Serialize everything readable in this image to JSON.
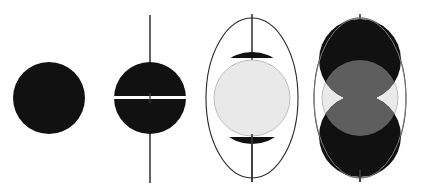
{
  "figure": {
    "title": "Four-stage circle and ellipse construction sequence",
    "background_color": "#ffffff",
    "width": 422,
    "height": 194,
    "panel_count": 4
  },
  "palette": {
    "black": "#111111",
    "dark_fill": "#0d0d0d",
    "mid_gray": "#5e5e5e",
    "light_gray": "#e9e9e9",
    "light_gray_stroke": "#bdbdbd",
    "axis_line": "#3a3a3a",
    "ellipse_stroke": "#262626",
    "white": "#ffffff"
  },
  "panels": [
    {
      "id": "panel-1",
      "label": "Solid disc",
      "center_x": 49,
      "center_y": 98,
      "shapes": [
        {
          "kind": "circle",
          "name": "solid-black-disc",
          "cx": 49,
          "cy": 98,
          "r": 36,
          "fill": "#111111",
          "stroke": "none"
        }
      ],
      "has_axis": false,
      "has_ellipse": false
    },
    {
      "id": "panel-2",
      "label": "Disc bisected by equatorial gap with polar axis",
      "center_x": 150,
      "center_y": 98,
      "shapes": [
        {
          "kind": "circle",
          "name": "black-disc",
          "cx": 150,
          "cy": 98,
          "r": 36,
          "fill": "#111111",
          "stroke": "none"
        },
        {
          "kind": "band",
          "name": "equatorial-white-gap",
          "x": 112,
          "y": 96,
          "width": 76,
          "height": 3,
          "fill": "#ffffff"
        }
      ],
      "has_axis": true,
      "axis": {
        "x": 150,
        "y1": 15,
        "y2": 183,
        "width": 1.6,
        "color": "#3a3a3a"
      },
      "has_ellipse": false
    },
    {
      "id": "panel-3",
      "label": "Ellipse with polar caps and central light disc",
      "center_x": 252,
      "center_y": 98,
      "shapes": [
        {
          "kind": "ellipse",
          "name": "outer-ellipse-outline",
          "cx": 252,
          "cy": 98,
          "rx": 46,
          "ry": 80,
          "fill": "none",
          "stroke": "#262626",
          "stroke_width": 1.1
        },
        {
          "kind": "cap",
          "name": "top-polar-cap",
          "cx": 252,
          "cy": 93,
          "r": 41,
          "flat_y": 58,
          "side": "top",
          "fill": "#111111"
        },
        {
          "kind": "cap",
          "name": "bottom-polar-cap",
          "cx": 252,
          "cy": 103,
          "r": 41,
          "flat_y": 137,
          "side": "bottom",
          "fill": "#111111"
        },
        {
          "kind": "circle",
          "name": "central-light-disc",
          "cx": 252,
          "cy": 98,
          "r": 38,
          "fill": "#e9e9e9",
          "stroke": "#bdbdbd",
          "stroke_width": 1
        }
      ],
      "has_axis": true,
      "axis": {
        "x": 252,
        "y1": 14,
        "y2": 182,
        "width": 1.6,
        "color": "#3a3a3a"
      },
      "has_ellipse": true
    },
    {
      "id": "panel-4",
      "label": "Ellipse with two overlapping discs and lens intersections",
      "center_x": 360,
      "center_y": 98,
      "shapes": [
        {
          "kind": "ellipse",
          "name": "outer-ellipse-outline",
          "cx": 360,
          "cy": 98,
          "rx": 46,
          "ry": 80,
          "fill": "none",
          "stroke": "#262626",
          "stroke_width": 1.1
        },
        {
          "kind": "circle",
          "name": "central-light-disc",
          "cx": 360,
          "cy": 98,
          "r": 38,
          "fill": "#e9e9e9",
          "stroke": "#bdbdbd",
          "stroke_width": 1
        },
        {
          "kind": "circle",
          "name": "upper-black-disc",
          "cx": 360,
          "cy": 60,
          "r": 41,
          "fill": "#111111"
        },
        {
          "kind": "circle",
          "name": "lower-black-disc",
          "cx": 360,
          "cy": 136,
          "r": 41,
          "fill": "#111111"
        },
        {
          "kind": "lens",
          "name": "upper-intersection-lens",
          "fill": "#5e5e5e"
        },
        {
          "kind": "lens",
          "name": "lower-intersection-lens",
          "fill": "#5e5e5e"
        }
      ],
      "has_axis": true,
      "axis": {
        "x": 360,
        "y1": 14,
        "y2": 182,
        "width": 1.6,
        "color": "#3a3a3a"
      },
      "has_ellipse": true
    }
  ]
}
